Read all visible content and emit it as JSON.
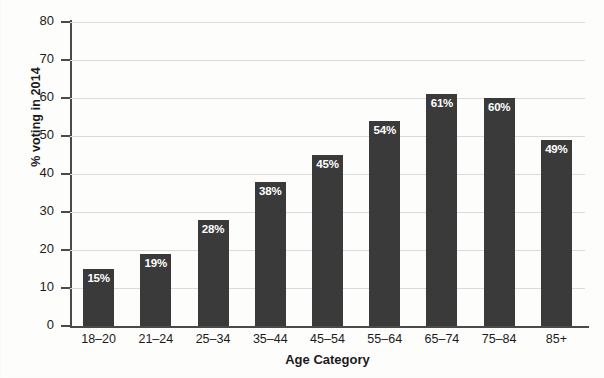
{
  "chart_data": {
    "type": "bar",
    "title": "",
    "xlabel": "Age Category",
    "ylabel": "% voting in 2014",
    "categories": [
      "18–20",
      "21–24",
      "25–34",
      "35–44",
      "45–54",
      "55–64",
      "65–74",
      "75–84",
      "85+"
    ],
    "values": [
      15,
      19,
      28,
      38,
      45,
      54,
      61,
      60,
      49
    ],
    "data_labels": [
      "15%",
      "19%",
      "28%",
      "38%",
      "45%",
      "54%",
      "61%",
      "60%",
      "49%"
    ],
    "ylim": [
      0,
      80
    ],
    "ytick_values": [
      80,
      70,
      60,
      50,
      40,
      30,
      20,
      10,
      0
    ],
    "ytick_labels": [
      "80",
      "70",
      "60",
      "50",
      "40",
      "30",
      "20",
      "10",
      "0"
    ],
    "grid": "horizontal",
    "legend": "none",
    "bar_color": "#3a3a3a",
    "grid_color": "#d8dadc",
    "axis_color": "#4a4a4a",
    "label_text_color": "#ffffff",
    "background_color": "#fdfdfc"
  }
}
